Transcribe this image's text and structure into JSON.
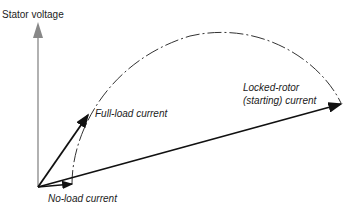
{
  "diagram": {
    "axis_label": "Stator voltage",
    "labels": {
      "full_load": "Full-load current",
      "locked_rotor_line1": "Locked-rotor",
      "locked_rotor_line2": "(starting) current",
      "no_load": "No-load current"
    },
    "colors": {
      "axis": "#888888",
      "vectors": "#111111",
      "circle": "#333333"
    }
  }
}
